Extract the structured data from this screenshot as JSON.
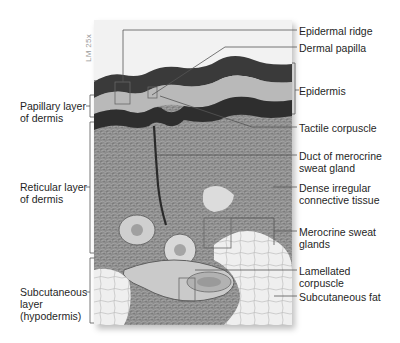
{
  "figure": {
    "magnification": "LM 25x",
    "left_labels": [
      {
        "id": "papillary",
        "line1": "Papillary layer",
        "line2": "of dermis"
      },
      {
        "id": "reticular",
        "line1": "Reticular layer",
        "line2": "of dermis"
      },
      {
        "id": "subcutaneous",
        "line1": "Subcutaneous",
        "line2": "layer",
        "line3": "(hypodermis)"
      }
    ],
    "right_labels": [
      {
        "id": "epidermal-ridge",
        "line1": "Epidermal ridge"
      },
      {
        "id": "dermal-papilla",
        "line1": "Dermal papilla"
      },
      {
        "id": "epidermis",
        "line1": "Epidermis"
      },
      {
        "id": "tactile-corpuscle",
        "line1": "Tactile corpuscle"
      },
      {
        "id": "duct",
        "line1": "Duct of merocrine",
        "line2": "sweat gland"
      },
      {
        "id": "dense-tissue",
        "line1": "Dense irregular",
        "line2": "connective tissue"
      },
      {
        "id": "sweat-glands",
        "line1": "Merocrine sweat",
        "line2": "glands"
      },
      {
        "id": "lamellated",
        "line1": "Lamellated",
        "line2": "corpuscle"
      },
      {
        "id": "subcutaneous-fat",
        "line1": "Subcutaneous fat"
      }
    ],
    "colors": {
      "line": "#555555",
      "text": "#1f1f1f",
      "mag_text": "#9a9a9a"
    }
  }
}
